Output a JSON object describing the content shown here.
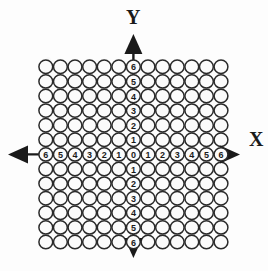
{
  "figure": {
    "title_visible": false,
    "background_color": "#fdfdfd",
    "circle_fill": "#fbfbfb",
    "circle_stroke": "#2a2a2a",
    "axis_color": "#1a1a1a"
  },
  "axes": {
    "x_label": "X",
    "y_label": "Y",
    "origin_label": "0"
  },
  "chart_data": {
    "type": "scatter",
    "title": "",
    "xlabel": "X",
    "ylabel": "Y",
    "grid": true,
    "legend": "none",
    "xlim": [
      -6,
      6
    ],
    "ylim": [
      -6,
      6
    ],
    "x_tick_labels": [
      "6",
      "5",
      "4",
      "3",
      "2",
      "1",
      "0",
      "1",
      "2",
      "3",
      "4",
      "5",
      "6"
    ],
    "y_tick_labels_top_to_bottom": [
      "6",
      "5",
      "4",
      "3",
      "2",
      "1",
      "0",
      "1",
      "2",
      "3",
      "4",
      "5",
      "6"
    ],
    "x": [
      -6,
      -5,
      -4,
      -3,
      -2,
      -1,
      0,
      1,
      2,
      3,
      4,
      5,
      6
    ],
    "y": [
      -6,
      -5,
      -4,
      -3,
      -2,
      -1,
      0,
      1,
      2,
      3,
      4,
      5,
      6
    ],
    "marker": "open-circle",
    "grid_rows": 13,
    "grid_cols": 13,
    "total_markers": 169
  },
  "geometry": {
    "cell": 14.6,
    "radius": 6.9,
    "grid_left": 38.5,
    "grid_top": 59.5,
    "cols": 13,
    "rows": 13,
    "origin_col": 6,
    "origin_row": 6,
    "x_arrow_left_tip": 8,
    "x_arrow_right_tip": 240,
    "y_arrow_top_tip": 34,
    "y_arrow_bottom_tip": 258,
    "x_label_pos": [
      249,
      146
    ],
    "y_label_pos": [
      126,
      24
    ]
  }
}
